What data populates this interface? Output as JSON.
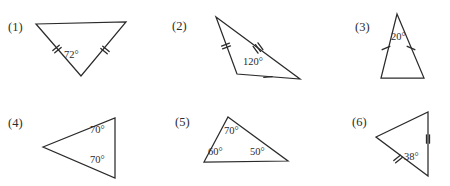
{
  "worksheet": {
    "title": "Triangle angle figures",
    "background_color": "#ffffff",
    "line_color": "#2b2b2b"
  },
  "figures": [
    {
      "number": "(1)",
      "number_pos": {
        "x": 8,
        "y": 31
      },
      "description": "inverted triangle, apex pointing down, isosceles with two congruent slanted sides",
      "points": "36,24 126,22 81,76",
      "angles": [
        {
          "label": "72°",
          "x": 64,
          "y": 58
        }
      ],
      "ticks": [
        {
          "name": "tick-left-double",
          "count": 2,
          "x": 57,
          "y": 49,
          "angle": 50
        },
        {
          "name": "tick-right-double",
          "count": 2,
          "x": 105,
          "y": 50,
          "angle": -50
        }
      ]
    },
    {
      "number": "(2)",
      "number_pos": {
        "x": 172,
        "y": 30
      },
      "description": "obtuse scalene triangle with 120 degree angle at bottom left vertex",
      "points": "216,17 300,79 237,74",
      "angles": [
        {
          "label": "120°",
          "x": 243,
          "y": 65
        }
      ],
      "ticks": [
        {
          "name": "tick-upper-left-double",
          "count": 2,
          "x": 226,
          "y": 46,
          "angle": 70
        },
        {
          "name": "tick-hypotenuse-triple",
          "count": 3,
          "x": 258,
          "y": 48,
          "angle": -36
        },
        {
          "name": "tick-base-single",
          "count": 1,
          "x": 268,
          "y": 77,
          "angle": 85
        }
      ]
    },
    {
      "number": "(3)",
      "number_pos": {
        "x": 355,
        "y": 31
      },
      "description": "tall narrow isosceles triangle with 20 degree apex angle",
      "points": "397,14 424,78 381,78",
      "angles": [
        {
          "label": "20°",
          "x": 391,
          "y": 40
        }
      ],
      "ticks": [
        {
          "name": "tick-left-single",
          "count": 1,
          "x": 386,
          "y": 48,
          "angle": 66
        },
        {
          "name": "tick-right-single",
          "count": 1,
          "x": 411,
          "y": 48,
          "angle": -66
        }
      ]
    },
    {
      "number": "(4)",
      "number_pos": {
        "x": 8,
        "y": 127
      },
      "description": "triangle pointing left with vertical right side and two base angles of 70 degrees",
      "points": "43,147 115,118 115,178",
      "angles": [
        {
          "label": "70°",
          "x": 90,
          "y": 133
        },
        {
          "label": "70°",
          "x": 90,
          "y": 163
        }
      ],
      "ticks": []
    },
    {
      "number": "(5)",
      "number_pos": {
        "x": 175,
        "y": 126
      },
      "description": "scalene triangle with all three interior angles labelled",
      "points": "228,117 288,161 204,162",
      "angles": [
        {
          "label": "70°",
          "x": 224,
          "y": 134
        },
        {
          "label": "60°",
          "x": 208,
          "y": 155
        },
        {
          "label": "50°",
          "x": 250,
          "y": 155
        }
      ],
      "ticks": []
    },
    {
      "number": "(6)",
      "number_pos": {
        "x": 352,
        "y": 126
      },
      "description": "triangle pointing left with vertical right side, 38 degree angle at bottom right",
      "points": "376,137 428,112 428,176",
      "angles": [
        {
          "label": "38°",
          "x": 404,
          "y": 160
        }
      ],
      "ticks": [
        {
          "name": "tick-right-side-double",
          "count": 2,
          "x": 428,
          "y": 139,
          "angle": 0
        },
        {
          "name": "tick-lower-left-double",
          "count": 2,
          "x": 398,
          "y": 159,
          "angle": 51
        }
      ]
    }
  ]
}
